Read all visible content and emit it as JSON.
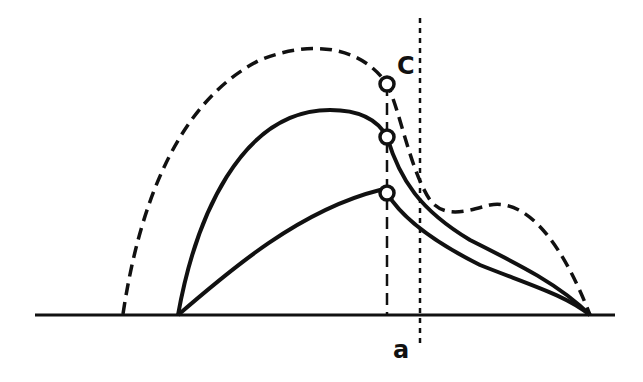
{
  "diagram": {
    "labels": {
      "point_c": "C",
      "axis_a": "a"
    },
    "colors": {
      "ink": "#111111",
      "background": "#ffffff"
    },
    "elements": [
      {
        "name": "baseline",
        "style": "solid"
      },
      {
        "name": "outer-dashed-curve",
        "style": "dashed"
      },
      {
        "name": "upper-solid-curve",
        "style": "solid"
      },
      {
        "name": "lower-solid-curve",
        "style": "solid"
      },
      {
        "name": "dashed-vertical-line",
        "style": "dashed"
      },
      {
        "name": "dotted-vertical-line-a",
        "style": "dotted"
      },
      {
        "name": "marker-top-c",
        "style": "open-circle"
      },
      {
        "name": "marker-middle",
        "style": "open-circle"
      },
      {
        "name": "marker-bottom",
        "style": "open-circle"
      }
    ]
  }
}
